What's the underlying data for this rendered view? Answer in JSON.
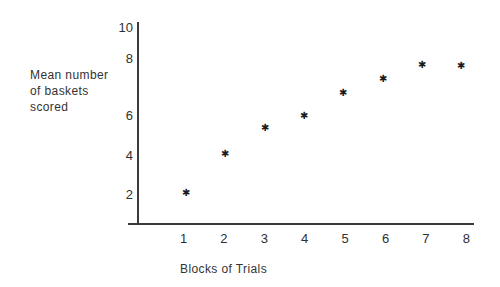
{
  "figure": {
    "background": "#ffffff",
    "ink_color": "#333333",
    "axis_color": "#3a3a3a"
  },
  "chart_data": {
    "type": "scatter",
    "title": "",
    "xlabel": "Blocks of Trials",
    "ylabel": "Mean number of baskets scored",
    "ylabel_lines": [
      "Mean number",
      "of baskets",
      "scored"
    ],
    "x": [
      1,
      2,
      3,
      4,
      5,
      6,
      7,
      8
    ],
    "y": [
      2.1,
      4.1,
      5.4,
      6.0,
      6.8,
      7.3,
      7.8,
      7.75
    ],
    "x_ticks": [
      1,
      2,
      3,
      4,
      5,
      6,
      7,
      8
    ],
    "y_ticks": [
      2,
      4,
      6,
      8,
      10
    ],
    "xlim": [
      0.5,
      8.5
    ],
    "ylim": [
      0,
      10
    ],
    "grid": false,
    "legend": "none",
    "marker": "asterisk",
    "marker_glyph": "✱"
  }
}
